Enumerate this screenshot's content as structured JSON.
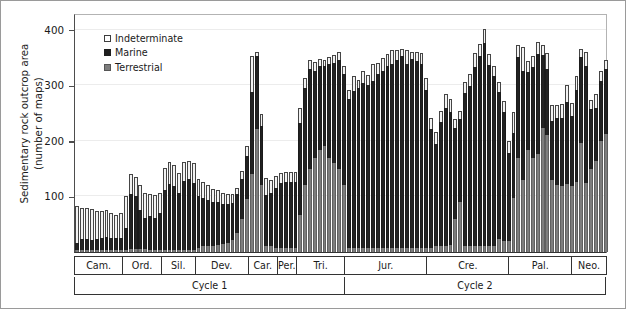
{
  "axis": {
    "ylabel_line1": "Sedimentary rock outcrop area",
    "ylabel_line2": "(number of maps)",
    "yticks": [
      100,
      200,
      300,
      400
    ],
    "ytick_labels": [
      "100",
      "200",
      "300",
      "400"
    ]
  },
  "legend": {
    "position": "top-left-inside",
    "items": [
      {
        "key": "indeterminate",
        "label": "Indeterminate",
        "color": "#ffffff"
      },
      {
        "key": "marine",
        "label": "Marine",
        "color": "#1f1f1f"
      },
      {
        "key": "terrestrial",
        "label": "Terrestrial",
        "color": "#7d7d7d"
      }
    ]
  },
  "periods": [
    {
      "label": "Cam.",
      "bars": 10
    },
    {
      "label": "Ord.",
      "bars": 8
    },
    {
      "label": "Sil.",
      "bars": 7
    },
    {
      "label": "Dev.",
      "bars": 11
    },
    {
      "label": "Car.",
      "bars": 6
    },
    {
      "label": "Per.",
      "bars": 4
    },
    {
      "label": "Tri.",
      "bars": 10
    },
    {
      "label": "Jur.",
      "bars": 17
    },
    {
      "label": "Cre.",
      "bars": 17
    },
    {
      "label": "Pal.",
      "bars": 13
    },
    {
      "label": "Neo.",
      "bars": 7
    }
  ],
  "cycles": [
    {
      "label": "Cycle 1",
      "bars": 56
    },
    {
      "label": "Cycle 2",
      "bars": 54
    }
  ],
  "chart_data": {
    "type": "bar",
    "subtype": "stacked-bar",
    "title": "",
    "xlabel": "",
    "ylabel": "Sedimentary rock outcrop area (number of maps)",
    "ylim": [
      0,
      430
    ],
    "xlim_bins": 110,
    "grid": true,
    "grid_axis": "y",
    "grid_values": [
      100,
      200,
      300,
      400
    ],
    "stack_order": [
      "terrestrial",
      "marine",
      "indeterminate"
    ],
    "series": [
      {
        "name": "Terrestrial",
        "color": "#7d7d7d",
        "values": [
          3,
          4,
          4,
          3,
          4,
          4,
          3,
          4,
          3,
          3,
          4,
          5,
          5,
          5,
          5,
          4,
          4,
          4,
          4,
          4,
          4,
          4,
          4,
          4,
          4,
          8,
          10,
          10,
          10,
          12,
          14,
          16,
          22,
          34,
          60,
          96,
          140,
          222,
          120,
          10,
          10,
          8,
          8,
          8,
          8,
          8,
          66,
          120,
          150,
          170,
          184,
          190,
          170,
          160,
          150,
          120,
          8,
          8,
          8,
          8,
          8,
          8,
          8,
          8,
          8,
          8,
          8,
          8,
          8,
          8,
          8,
          8,
          8,
          8,
          10,
          10,
          10,
          12,
          60,
          90,
          10,
          10,
          10,
          10,
          10,
          10,
          10,
          24,
          20,
          20,
          98,
          170,
          130,
          184,
          170,
          176,
          224,
          210,
          130,
          120,
          118,
          122,
          118,
          126,
          196,
          124,
          150,
          164,
          200,
          212
        ]
      },
      {
        "name": "Marine",
        "color": "#1f1f1f",
        "values": [
          14,
          20,
          20,
          18,
          20,
          22,
          24,
          22,
          22,
          22,
          40,
          100,
          96,
          70,
          56,
          60,
          58,
          66,
          108,
          118,
          114,
          102,
          124,
          128,
          120,
          92,
          88,
          84,
          80,
          78,
          72,
          70,
          66,
          70,
          72,
          76,
          148,
          130,
          106,
          92,
          96,
          108,
          116,
          118,
          118,
          118,
          166,
          176,
          180,
          156,
          150,
          144,
          168,
          180,
          196,
          200,
          268,
          282,
          288,
          296,
          292,
          300,
          312,
          318,
          326,
          330,
          338,
          344,
          330,
          340,
          336,
          330,
          284,
          214,
          184,
          224,
          250,
          240,
          164,
          150,
          276,
          288,
          322,
          342,
          366,
          326,
          306,
          264,
          232,
          158,
          116,
          180,
          196,
          140,
          162,
          180,
          130,
          120,
          106,
          122,
          124,
          148,
          126,
          166,
          154,
          210,
          108,
          96,
          108,
          118
        ]
      },
      {
        "name": "Indeterminate",
        "color": "#ffffff",
        "values": [
          66,
          56,
          56,
          56,
          50,
          48,
          48,
          44,
          42,
          46,
          56,
          36,
          34,
          46,
          46,
          40,
          40,
          36,
          40,
          40,
          38,
          36,
          34,
          32,
          36,
          32,
          28,
          26,
          24,
          22,
          20,
          18,
          16,
          12,
          14,
          18,
          64,
          8,
          22,
          32,
          24,
          20,
          18,
          18,
          18,
          18,
          28,
          18,
          16,
          16,
          14,
          12,
          12,
          14,
          14,
          14,
          16,
          26,
          14,
          22,
          18,
          30,
          20,
          24,
          22,
          26,
          18,
          14,
          26,
          12,
          16,
          20,
          22,
          20,
          22,
          20,
          24,
          24,
          16,
          14,
          20,
          22,
          26,
          22,
          26,
          20,
          18,
          18,
          20,
          22,
          38,
          22,
          42,
          20,
          20,
          22,
          18,
          28,
          28,
          22,
          24,
          30,
          24,
          24,
          16,
          26,
          16,
          24,
          18,
          16
        ]
      }
    ]
  }
}
